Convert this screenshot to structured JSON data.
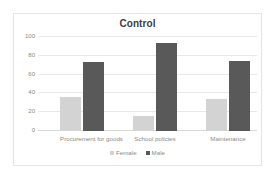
{
  "chart_data": {
    "type": "bar",
    "title": "Control",
    "xlabel": "",
    "ylabel": "",
    "ylim": [
      0,
      100
    ],
    "yticks": [
      "0",
      "20",
      "40",
      "60",
      "80",
      "100"
    ],
    "ytick_values": [
      0,
      20,
      40,
      60,
      80,
      100
    ],
    "grid": true,
    "legend_position": "bottom",
    "categories": [
      "Procurement for goods",
      "School policies",
      "Maintenance"
    ],
    "series": [
      {
        "name": "Female",
        "color": "#d3d3d3",
        "values": [
          36,
          16,
          34
        ]
      },
      {
        "name": "Male",
        "color": "#595959",
        "values": [
          73,
          94,
          75
        ]
      }
    ]
  },
  "legend": {
    "items": [
      {
        "label": "Female",
        "color": "#d3d3d3"
      },
      {
        "label": "Male",
        "color": "#595959"
      }
    ]
  }
}
